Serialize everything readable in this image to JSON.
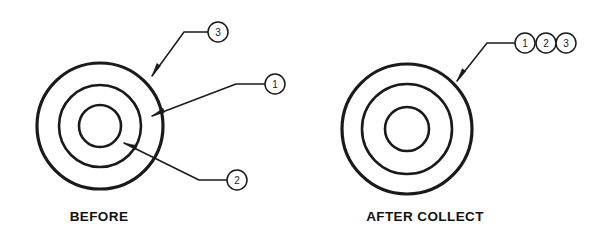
{
  "figure": {
    "background_color": "#ffffff",
    "line_color": "#1a1a1a",
    "balloon_fill": "#ffffff",
    "width": 605,
    "height": 239
  },
  "panels": [
    {
      "id": "before",
      "caption": "BEFORE",
      "caption_x": 99,
      "caption_y": 221,
      "center_x": 100,
      "center_y": 126,
      "rings": [
        {
          "name": "outer-ring",
          "radius": 63,
          "stroke_width": 3.2
        },
        {
          "name": "middle-ring",
          "radius": 41,
          "stroke_width": 2.6
        },
        {
          "name": "inner-ring",
          "radius": 21,
          "stroke_width": 2.6
        }
      ],
      "callouts": [
        {
          "number": "3",
          "balloon_x": 218,
          "balloon_y": 32,
          "balloon_r": 10,
          "elbow_x": 184,
          "elbow_y": 32,
          "tip_x": 152,
          "tip_y": 76,
          "target": "outer-ring"
        },
        {
          "number": "1",
          "balloon_x": 275,
          "balloon_y": 84,
          "balloon_r": 10,
          "elbow_x": 236,
          "elbow_y": 84,
          "tip_x": 152,
          "tip_y": 116,
          "target": "middle-ring"
        },
        {
          "number": "2",
          "balloon_x": 237,
          "balloon_y": 180,
          "balloon_r": 10,
          "elbow_x": 199,
          "elbow_y": 180,
          "tip_x": 124,
          "tip_y": 143,
          "target": "inner-ring"
        }
      ]
    },
    {
      "id": "after-collect",
      "caption": "AFTER COLLECT",
      "caption_x": 425,
      "caption_y": 221,
      "center_x": 407,
      "center_y": 129,
      "rings": [
        {
          "name": "outer-ring",
          "radius": 65,
          "stroke_width": 3.2
        },
        {
          "name": "middle-ring",
          "radius": 45,
          "stroke_width": 2.6
        },
        {
          "name": "inner-ring",
          "radius": 22,
          "stroke_width": 2.6
        }
      ],
      "callouts": [
        {
          "number": "1",
          "balloon_x": 525,
          "balloon_y": 43,
          "balloon_r": 10,
          "elbow_x": 487,
          "elbow_y": 43,
          "tip_x": 457,
          "tip_y": 81,
          "target": "outer-ring"
        },
        {
          "number": "2",
          "balloon_x": 546,
          "balloon_y": 43,
          "balloon_r": 10
        },
        {
          "number": "3",
          "balloon_x": 566,
          "balloon_y": 43,
          "balloon_r": 10
        }
      ]
    }
  ]
}
